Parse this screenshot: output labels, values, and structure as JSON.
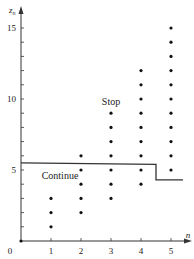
{
  "chart_data": {
    "type": "scatter",
    "title": "",
    "xlabel": "n",
    "ylabel": "z_n",
    "ylabel_display": "z",
    "ylabel_sub": "n",
    "origin_label": "0",
    "xlim": [
      0,
      5.6
    ],
    "ylim": [
      0,
      16.4
    ],
    "x_ticks": [
      1,
      2,
      3,
      4,
      5
    ],
    "x_tick_labels": [
      "1",
      "2",
      "3",
      "4",
      "5"
    ],
    "y_ticks": [
      1,
      2,
      3,
      4,
      5,
      6,
      7,
      8,
      9,
      10,
      11,
      12,
      13,
      14,
      15
    ],
    "y_tick_labels": [
      {
        "value": 5,
        "label": "5"
      },
      {
        "value": 10,
        "label": "10"
      },
      {
        "value": 15,
        "label": "15"
      }
    ],
    "grid": false,
    "series": [
      {
        "name": "possible values",
        "points": [
          [
            0,
            0
          ],
          [
            1,
            1
          ],
          [
            1,
            2
          ],
          [
            1,
            3
          ],
          [
            2,
            2
          ],
          [
            2,
            3
          ],
          [
            2,
            4
          ],
          [
            2,
            5
          ],
          [
            2,
            6
          ],
          [
            3,
            3
          ],
          [
            3,
            4
          ],
          [
            3,
            5
          ],
          [
            3,
            6
          ],
          [
            3,
            7
          ],
          [
            3,
            8
          ],
          [
            3,
            9
          ],
          [
            4,
            4
          ],
          [
            4,
            5
          ],
          [
            4,
            6
          ],
          [
            4,
            7
          ],
          [
            4,
            8
          ],
          [
            4,
            9
          ],
          [
            4,
            10
          ],
          [
            4,
            11
          ],
          [
            4,
            12
          ],
          [
            5,
            5
          ],
          [
            5,
            6
          ],
          [
            5,
            7
          ],
          [
            5,
            8
          ],
          [
            5,
            9
          ],
          [
            5,
            10
          ],
          [
            5,
            11
          ],
          [
            5,
            12
          ],
          [
            5,
            13
          ],
          [
            5,
            14
          ],
          [
            5,
            15
          ]
        ]
      }
    ],
    "boundary": {
      "name": "stopping boundary",
      "points": [
        [
          0,
          5.5
        ],
        [
          4.5,
          5.4
        ],
        [
          4.5,
          4.3
        ],
        [
          5.4,
          4.3
        ]
      ]
    },
    "annotations": [
      {
        "text": "Stop",
        "x": 3,
        "y": 9.6
      },
      {
        "text": "Continue",
        "x": 1.3,
        "y": 4.4
      }
    ],
    "colors": {
      "axis": "#333333",
      "points": "#111111",
      "boundary": "#333333",
      "text": "#222222"
    }
  }
}
